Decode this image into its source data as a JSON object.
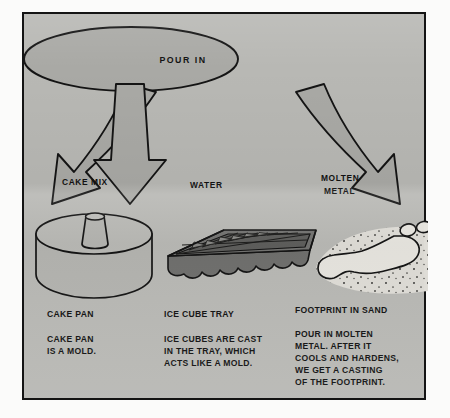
{
  "diagram": {
    "title_bubble": {
      "label": "POUR IN"
    },
    "arrows": [
      {
        "name": "cake-mix-arrow",
        "label": "CAKE MIX",
        "direction": "down-left"
      },
      {
        "name": "water-arrow",
        "label": "WATER",
        "direction": "down"
      },
      {
        "name": "molten-metal-arrow",
        "label_line1": "MOLTEN",
        "label_line2": "METAL",
        "direction": "down-right"
      }
    ],
    "columns": [
      {
        "name": "cake-pan",
        "illustration": "tube-cake-pan",
        "heading": "CAKE PAN",
        "body": [
          "CAKE PAN",
          "IS A MOLD."
        ]
      },
      {
        "name": "ice-cube-tray",
        "illustration": "ice-cube-tray",
        "heading": "ICE CUBE TRAY",
        "body": [
          "ICE CUBES ARE CAST",
          "IN THE TRAY, WHICH",
          "ACTS LIKE A MOLD."
        ]
      },
      {
        "name": "footprint-in-sand",
        "illustration": "footprint-in-sand",
        "heading": "FOOTPRINT IN SAND",
        "body": [
          "POUR IN MOLTEN",
          "METAL. AFTER IT",
          "COOLS AND HARDENS,",
          "WE GET A CASTING",
          "OF THE FOOTPRINT."
        ]
      }
    ],
    "colors": {
      "panel_background": "#b8b8b4",
      "border": "#141414",
      "shape_fill": "#a9a9a5",
      "ink": "#111111",
      "tray_dark": "#6f6f6d",
      "sand_light": "#dedcd6"
    }
  }
}
